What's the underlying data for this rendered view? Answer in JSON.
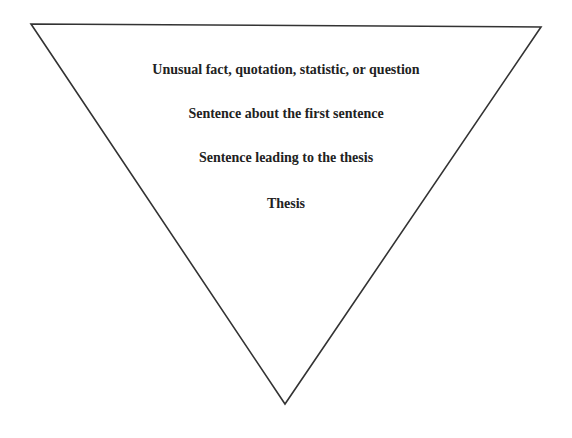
{
  "diagram": {
    "type": "inverted-triangle",
    "stroke_color": "#333333",
    "vertices": {
      "top_left": [
        31,
        24
      ],
      "top_right": [
        541,
        27
      ],
      "bottom": [
        285,
        404
      ]
    },
    "levels": [
      {
        "text": "Unusual fact, quotation, statistic, or question"
      },
      {
        "text": "Sentence about the first sentence"
      },
      {
        "text": "Sentence leading to the thesis"
      },
      {
        "text": "Thesis"
      }
    ]
  }
}
